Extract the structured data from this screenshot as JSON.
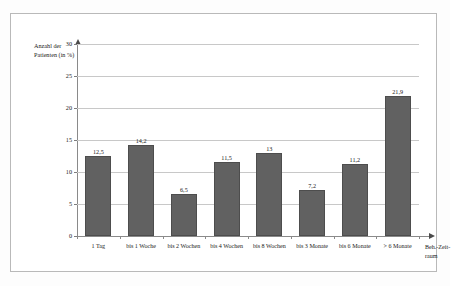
{
  "chart_data": {
    "type": "bar",
    "title": "",
    "subtitle": "",
    "xlabel_lines": [
      "Beh.-Zeit-",
      "raum"
    ],
    "ylabel_lines": [
      "Anzahl der",
      "Patienten (in %)"
    ],
    "categories": [
      "1 Tag",
      "bis 1 Woche",
      "bis 2 Wochen",
      "bis 4 Wochen",
      "bis 8 Wochen",
      "bis 3 Monate",
      "bis 6 Monate",
      "> 6 Monate"
    ],
    "values": [
      12.5,
      14.2,
      6.5,
      11.5,
      13,
      7.2,
      11.2,
      21.9
    ],
    "value_labels": [
      "12,5",
      "14,2",
      "6,5",
      "11,5",
      "13",
      "7,2",
      "11,2",
      "21,9"
    ],
    "ylim": [
      0,
      30
    ],
    "yticks": [
      0,
      5,
      10,
      15,
      20,
      25,
      30
    ],
    "ytick_labels": [
      "0",
      "5",
      "10",
      "15",
      "20",
      "25",
      "30"
    ],
    "grid": true,
    "legend": false,
    "bar_color": "#616161",
    "grid_color": "#c8c8c8",
    "axis_color": "#8a8a8a",
    "frame_color": "#b9b9b9"
  }
}
